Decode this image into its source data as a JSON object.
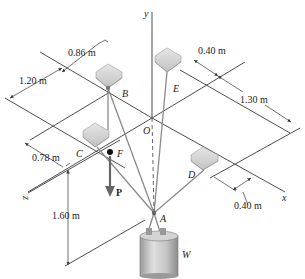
{
  "figure": {
    "axes": {
      "x": "x",
      "y": "y",
      "z": "z"
    },
    "points": {
      "A": "A",
      "B": "B",
      "C": "C",
      "D": "D",
      "E": "E",
      "F": "F",
      "O": "O"
    },
    "load_force": "P",
    "weight": "W",
    "dimensions": {
      "d_086": "0.86 m",
      "d_120": "1.20 m",
      "d_078": "0.78 m",
      "d_160": "1.60 m",
      "d_040_top": "0.40 m",
      "d_130": "1.30 m",
      "d_040_right": "0.40 m"
    },
    "colors": {
      "line": "#3a3a3a",
      "cable": "#8a8a8a",
      "bracket": "#c8c8c8",
      "bucket": "#bdbdbd"
    }
  }
}
